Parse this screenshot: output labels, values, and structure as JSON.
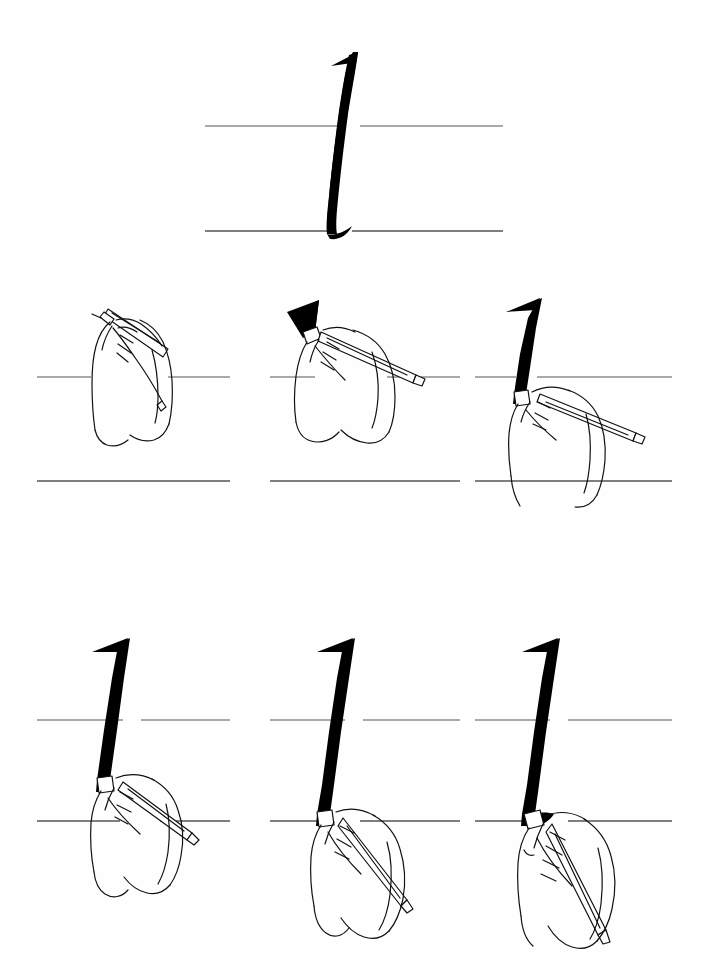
{
  "document": {
    "type": "calligraphy-stroke-instruction-sheet",
    "title": "Broad-edge pen stroke: the letter l / numeral 1",
    "background_color": "#fefefe",
    "ink_color": "#000000",
    "guideline_color": "#555555",
    "outline_color": "#111111",
    "page_width": 712,
    "page_height": 975
  },
  "exemplar": {
    "label": "Finished stroke exemplar",
    "glyph": "1",
    "guidelines": {
      "waistline_y": 126,
      "baseline_y": 231,
      "line_start_x": 205,
      "line_end_x": 503
    },
    "stroke": {
      "apex_x": 358,
      "apex_y": 52,
      "foot_x": 334,
      "foot_y": 233,
      "has_entry_flag": true,
      "has_exit_flick": true
    }
  },
  "steps": [
    {
      "index": 1,
      "label": "Step 1",
      "description": "Pen held at the writing angle, nib placed above the waistline, no ink laid down yet.",
      "ink": "none",
      "hand": "open grip, nib up",
      "guidelines": {
        "waistline_y": 377,
        "baseline_y": 481,
        "line_start_x": 37,
        "line_end_x": 230
      }
    },
    {
      "index": 2,
      "label": "Step 2",
      "description": "Short angled entry stroke pulled to form the flag at the top of the stem.",
      "ink": "entry-flag",
      "hand": "pen tilted, wrist raised",
      "guidelines": {
        "waistline_y": 377,
        "baseline_y": 481,
        "line_start_x": 270,
        "line_end_x": 460
      }
    },
    {
      "index": 3,
      "label": "Step 3",
      "description": "Stem pulled down through the waistline, keeping a constant pen angle.",
      "ink": "stem-to-waistline",
      "hand": "pen drawn downward",
      "guidelines": {
        "waistline_y": 377,
        "baseline_y": 481,
        "line_start_x": 475,
        "line_end_x": 672
      }
    },
    {
      "index": 4,
      "label": "Step 4",
      "description": "Stem continued most of the way toward the baseline.",
      "ink": "stem-most-of-way",
      "hand": "hand sliding down the page",
      "guidelines": {
        "waistline_y": 720,
        "baseline_y": 821,
        "line_start_x": 37,
        "line_end_x": 230
      }
    },
    {
      "index": 5,
      "label": "Step 5",
      "description": "Stem brought all the way down to rest on the baseline.",
      "ink": "stem-to-baseline",
      "hand": "nib resting on baseline",
      "guidelines": {
        "waistline_y": 720,
        "baseline_y": 821,
        "line_start_x": 270,
        "line_end_x": 460
      }
    },
    {
      "index": 6,
      "label": "Step 6",
      "description": "Finishing flick made at the baseline to complete the stroke.",
      "ink": "complete-stroke",
      "hand": "nib flicked right at the foot",
      "guidelines": {
        "waistline_y": 720,
        "baseline_y": 821,
        "line_start_x": 475,
        "line_end_x": 672
      }
    }
  ]
}
